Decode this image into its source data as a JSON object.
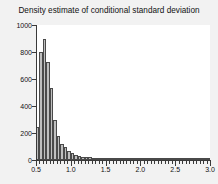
{
  "chart_data": {
    "type": "bar",
    "title": "Density estimate of conditional standard deviation",
    "xlabel": "",
    "ylabel": "",
    "xlim": [
      0.5,
      3.0
    ],
    "ylim": [
      0,
      1000
    ],
    "bin_width": 0.05,
    "grid": false,
    "legend": null,
    "bar_fill_color": "#bfbfbf",
    "bar_edge_color": "#4a4a4a",
    "plot_background": "#ffffff",
    "figure_background": "#f2f2f2",
    "ytick_labels": [
      "0",
      "200",
      "400",
      "600",
      "800",
      "1000"
    ],
    "ytick_values": [
      0,
      200,
      400,
      600,
      800,
      1000
    ],
    "xtick_labels": [
      "0.5",
      "1.0",
      "1.5",
      "2.0",
      "2.5",
      "3.0"
    ],
    "xtick_values": [
      0.5,
      1.0,
      1.5,
      2.0,
      2.5,
      3.0
    ],
    "bin_starts": [
      0.5,
      0.55,
      0.6,
      0.65,
      0.7,
      0.75,
      0.8,
      0.85,
      0.9,
      0.95,
      1.0,
      1.05,
      1.1,
      1.15,
      1.2,
      1.25,
      1.3,
      1.35,
      1.4,
      1.45,
      1.5,
      1.55,
      1.6,
      1.65,
      1.7,
      1.75,
      1.8,
      1.85,
      1.9,
      1.95,
      2.0,
      2.05,
      2.1,
      2.15,
      2.2,
      2.25,
      2.3,
      2.35,
      2.4,
      2.45,
      2.5,
      2.55,
      2.6,
      2.65,
      2.7,
      2.75,
      2.8,
      2.85,
      2.9,
      2.95
    ],
    "categories": [
      "0.50",
      "0.55",
      "0.60",
      "0.65",
      "0.70",
      "0.75",
      "0.80",
      "0.85",
      "0.90",
      "0.95",
      "1.00",
      "1.05",
      "1.10",
      "1.15",
      "1.20",
      "1.25",
      "1.30",
      "1.35",
      "1.40",
      "1.45",
      "1.50",
      "1.55",
      "1.60",
      "1.65",
      "1.70",
      "1.75",
      "1.80",
      "1.85",
      "1.90",
      "1.95",
      "2.00",
      "2.05",
      "2.10",
      "2.15",
      "2.20",
      "2.25",
      "2.30",
      "2.35",
      "2.40",
      "2.45",
      "2.50",
      "2.55",
      "2.60",
      "2.65",
      "2.70",
      "2.75",
      "2.80",
      "2.85",
      "2.90",
      "2.95"
    ],
    "values": [
      245,
      800,
      900,
      725,
      530,
      300,
      175,
      120,
      95,
      70,
      50,
      40,
      30,
      25,
      22,
      20,
      18,
      16,
      14,
      12,
      10,
      9,
      8,
      7,
      7,
      6,
      6,
      5,
      5,
      4,
      4,
      4,
      3,
      3,
      3,
      2,
      2,
      2,
      2,
      2,
      2,
      1,
      1,
      1,
      1,
      1,
      1,
      1,
      1,
      1
    ]
  }
}
